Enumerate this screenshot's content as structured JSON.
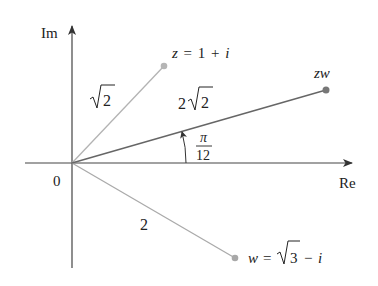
{
  "diagram": {
    "type": "complex-plane-multiplication",
    "axes": {
      "imag_label": "Im",
      "real_label": "Re",
      "origin_label": "0"
    },
    "points": {
      "z": {
        "label_lhs": "z",
        "label_eq": "=",
        "label_rhs_1": "1",
        "label_op": "+",
        "label_rhs_2": "i",
        "modulus_label": "√2"
      },
      "w": {
        "label_lhs": "w",
        "label_eq": "=",
        "label_rhs_1": "√3",
        "label_op": "−",
        "label_rhs_2": "i",
        "modulus_label": "2"
      },
      "zw": {
        "label": "zw",
        "modulus_label": "2√2"
      }
    },
    "angle": {
      "numerator": "π",
      "denominator": "12"
    },
    "colors": {
      "axis": "#333333",
      "z_vector": "#b0b0b0",
      "w_vector": "#a8a8a8",
      "zw_vector": "#666666",
      "z_point": "#b5b5b5",
      "w_point": "#a8a8a8",
      "zw_point": "#777777",
      "text": "#222222"
    }
  }
}
